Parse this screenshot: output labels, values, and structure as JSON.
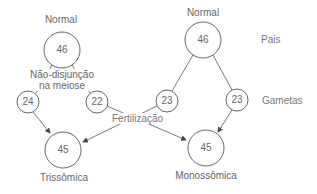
{
  "diagram": {
    "left_parent": {
      "label": "Normal",
      "value": "46"
    },
    "right_parent": {
      "label": "Normal",
      "value": "46"
    },
    "nondisjunction": {
      "line1": "Não-disjunção",
      "line2": "na meiose"
    },
    "gametes": [
      {
        "value": "24"
      },
      {
        "value": "22"
      },
      {
        "value": "23"
      },
      {
        "value": "23"
      }
    ],
    "fertilization_label": "Fertilização",
    "offspring": [
      {
        "value": "45",
        "label": "Trissômica"
      },
      {
        "value": "45",
        "label": "Monossômica"
      }
    ],
    "row_labels": {
      "parents": "Pais",
      "gametes": "Gametas"
    },
    "colors": {
      "stroke": "#555555",
      "text": "#666666"
    }
  }
}
